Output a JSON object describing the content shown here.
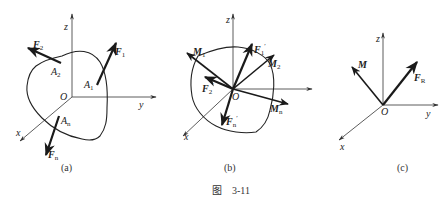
{
  "figure": {
    "caption": "图    3-11",
    "panels": [
      {
        "id": "a",
        "label": "(a)",
        "axes": {
          "z": "z",
          "y": "y",
          "x": "x",
          "origin": "O"
        },
        "forces": [
          {
            "name": "F",
            "sub": "2",
            "point": "A",
            "point_sub": "2"
          },
          {
            "name": "F",
            "sub": "1",
            "point": "A",
            "point_sub": "1"
          },
          {
            "name": "F",
            "sub": "n",
            "point": "A",
            "point_sub": "n"
          }
        ]
      },
      {
        "id": "b",
        "label": "(b)",
        "axes": {
          "z": "z",
          "y": "y",
          "x": "x",
          "origin": "O"
        },
        "vectors": [
          {
            "name": "M",
            "sub": "1"
          },
          {
            "name": "F",
            "sub": "1",
            "prime": "′"
          },
          {
            "name": "M",
            "sub": "2"
          },
          {
            "name": "F",
            "sub": "2",
            "prime": "′"
          },
          {
            "name": "M",
            "sub": "n"
          },
          {
            "name": "F",
            "sub": "n",
            "prime": "′"
          }
        ]
      },
      {
        "id": "c",
        "label": "(c)",
        "axes": {
          "z": "z",
          "y": "y",
          "x": "x",
          "origin": "O"
        },
        "vectors": [
          {
            "name": "M",
            "sub": ""
          },
          {
            "name": "F",
            "sub": "R"
          }
        ]
      }
    ]
  }
}
